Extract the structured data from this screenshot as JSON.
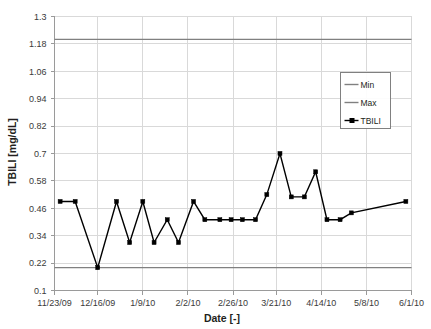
{
  "chart_data": {
    "type": "line",
    "title": "",
    "xlabel": "Date [-]",
    "ylabel": "TBILI [mg/dL]",
    "xtype": "date",
    "grid": true,
    "legend_position": "inside-top-right",
    "ylim": [
      0.1,
      1.3
    ],
    "yticks": [
      0.1,
      0.22,
      0.34,
      0.46,
      0.58,
      0.7,
      0.82,
      0.94,
      1.06,
      1.18,
      1.3
    ],
    "ytick_labels": [
      "0.1",
      "0.22",
      "0.34",
      "0.46",
      "0.58",
      "0.7",
      "0.82",
      "0.94",
      "1.06",
      "1.18",
      "1.3"
    ],
    "xlim": [
      "11/23/09",
      "6/1/10"
    ],
    "xticks": [
      "11/23/09",
      "12/16/09",
      "1/9/10",
      "2/2/10",
      "2/26/10",
      "3/21/10",
      "4/14/10",
      "5/8/10",
      "6/1/10"
    ],
    "xtick_days": [
      0,
      23,
      47,
      71,
      95,
      118,
      142,
      166,
      190
    ],
    "x_total_days": 190,
    "series": [
      {
        "name": "Min",
        "color": "#808080",
        "type": "reference-line",
        "value": 0.2,
        "marker": "none"
      },
      {
        "name": "Max",
        "color": "#808080",
        "type": "reference-line",
        "value": 1.2,
        "marker": "none"
      },
      {
        "name": "TBILI",
        "color": "#000000",
        "type": "line-with-markers",
        "marker": "square",
        "x_days": [
          3,
          11,
          23,
          33,
          40,
          47,
          53,
          60,
          66,
          74,
          80,
          88,
          94,
          100,
          107,
          113,
          120,
          126,
          133,
          139,
          145,
          152,
          158,
          187
        ],
        "x_labels": [
          "11/26/09",
          "12/4/09",
          "12/16/09",
          "12/26/09",
          "1/2/10",
          "1/9/10",
          "1/15/10",
          "1/22/10",
          "1/28/10",
          "2/5/10",
          "2/11/10",
          "2/19/10",
          "2/25/10",
          "3/3/10",
          "3/10/10",
          "3/16/10",
          "3/23/10",
          "3/29/10",
          "4/5/10",
          "4/11/10",
          "4/17/10",
          "4/24/10",
          "4/30/10",
          "5/29/10"
        ],
        "values": [
          0.49,
          0.49,
          0.2,
          0.49,
          0.31,
          0.49,
          0.31,
          0.41,
          0.31,
          0.49,
          0.41,
          0.41,
          0.41,
          0.41,
          0.41,
          0.52,
          0.7,
          0.51,
          0.51,
          0.62,
          0.41,
          0.41,
          0.44,
          0.49
        ]
      }
    ]
  },
  "legend": {
    "items": [
      {
        "label": "Min",
        "color": "#808080",
        "marker": "none"
      },
      {
        "label": "Max",
        "color": "#808080",
        "marker": "none"
      },
      {
        "label": "TBILI",
        "color": "#000000",
        "marker": "square"
      }
    ]
  }
}
